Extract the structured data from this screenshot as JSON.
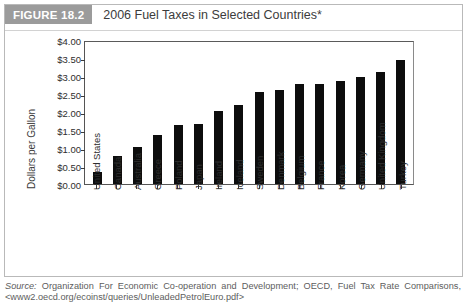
{
  "figure": {
    "tag": "FIGURE 18.2",
    "title": "2006 Fuel Taxes in Selected Countries*"
  },
  "source": {
    "label": "Source:",
    "text": "Organization For Economic Co-operation and Development; OECD, Fuel Tax Rate Comparisons,",
    "url": "<www2.oecd.org/ecoinst/queries/UnleadedPetrolEuro.pdf>"
  },
  "colors": {
    "bar": "#0d0d0d",
    "tag_background": "#9b9b9b",
    "frame": "#b9b9b9",
    "axis": "#555555"
  },
  "chart_data": {
    "type": "bar",
    "title": "2006 Fuel Taxes in Selected Countries*",
    "xlabel": "",
    "ylabel": "Dollars per Gallon",
    "ylim": [
      0,
      4
    ],
    "ytick_labels": [
      "$4.00",
      "$3.50",
      "$3.00",
      "$2.50",
      "$2.00",
      "$1.50",
      "$1.00",
      "$0.50",
      "$0.00"
    ],
    "ytick_values": [
      4.0,
      3.5,
      3.0,
      2.5,
      2.0,
      1.5,
      1.0,
      0.5,
      0.0
    ],
    "grid": false,
    "legend": null,
    "categories": [
      "United States",
      "Canada",
      "Australia",
      "Greece",
      "Poland",
      "Japan",
      "Ireland",
      "Iceland",
      "Sweden",
      "Denmark",
      "Belgium",
      "France",
      "Korea",
      "Germany",
      "United Kingdom",
      "Turkey"
    ],
    "values": [
      0.33,
      0.79,
      1.02,
      1.35,
      1.64,
      1.68,
      2.03,
      2.2,
      2.55,
      2.62,
      2.77,
      2.77,
      2.85,
      2.97,
      3.1,
      3.45
    ]
  }
}
